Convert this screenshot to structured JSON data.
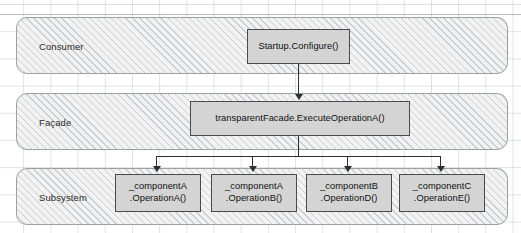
{
  "diagram": {
    "bands": [
      {
        "id": "consumer",
        "label": "Consumer"
      },
      {
        "id": "facade",
        "label": "Façade"
      },
      {
        "id": "subsystem",
        "label": "Subsystem"
      }
    ],
    "nodes": {
      "startup": {
        "label": "Startup.Configure()"
      },
      "facade": {
        "label": "transparentFacade.ExecuteOperationA()"
      },
      "compA_opA": {
        "label": "_componentA\n.OperationA()"
      },
      "compA_opB": {
        "label": "_componentA\n.OperationB()"
      },
      "compB_opD": {
        "label": "_componentB\n.OperationD()"
      },
      "compC_opE": {
        "label": "_componentC\n.OperationE()"
      }
    },
    "colors": {
      "node_fill": "#d4d4d4",
      "node_border": "#4a4a4a",
      "band_border": "#9aa0a6",
      "band_fill": "#f2f2f2",
      "connector": "#2f2f2f",
      "grid_line": "#96a0aa",
      "text": "#111111",
      "background": "#ffffff"
    }
  }
}
